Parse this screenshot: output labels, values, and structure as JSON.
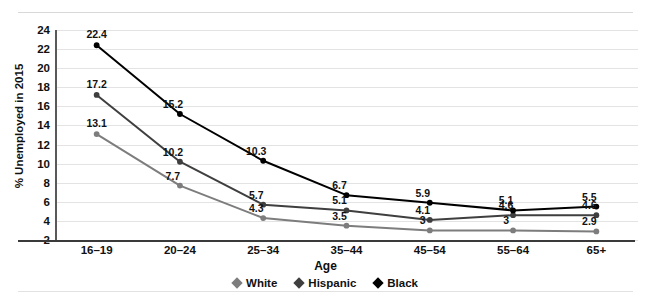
{
  "chart_data": {
    "type": "line",
    "title": "",
    "xlabel": "Age",
    "ylabel": "% Unemployed in 2015",
    "categories": [
      "16–19",
      "20–24",
      "25–34",
      "35–44",
      "45–54",
      "55–64",
      "65+"
    ],
    "ylim": [
      2,
      24
    ],
    "yticks": [
      2,
      4,
      6,
      8,
      10,
      12,
      14,
      16,
      18,
      20,
      22,
      24
    ],
    "grid": true,
    "legend_position": "bottom",
    "series": [
      {
        "name": "White",
        "color": "#7d7d7d",
        "values": [
          13.1,
          7.7,
          4.3,
          3.5,
          3.0,
          3.0,
          2.9
        ],
        "labels": [
          "13.1",
          "7.7",
          "4.3",
          "3.5",
          "3",
          "3",
          "2.9"
        ]
      },
      {
        "name": "Hispanic",
        "color": "#3f3f3f",
        "values": [
          17.2,
          10.2,
          5.7,
          5.1,
          4.1,
          4.6,
          4.6
        ],
        "labels": [
          "17.2",
          "10.2",
          "5.7",
          "5.1",
          "4.1",
          "4.6",
          "4.6"
        ]
      },
      {
        "name": "Black",
        "color": "#000000",
        "values": [
          22.4,
          15.2,
          10.3,
          6.7,
          5.9,
          5.1,
          5.5
        ],
        "labels": [
          "22.4",
          "15.2",
          "10.3",
          "6.7",
          "5.9",
          "5.1",
          "5.5"
        ]
      }
    ]
  },
  "legend": {
    "items": [
      {
        "label": "White",
        "color": "#7d7d7d"
      },
      {
        "label": "Hispanic",
        "color": "#3f3f3f"
      },
      {
        "label": "Black",
        "color": "#000000"
      }
    ]
  }
}
